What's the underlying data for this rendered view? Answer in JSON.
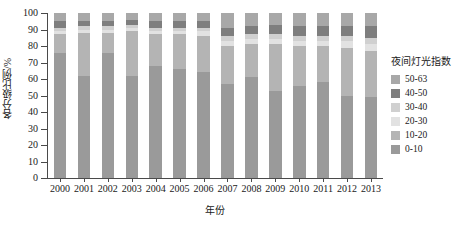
{
  "chart_data": {
    "type": "bar",
    "stacked": true,
    "title": "",
    "xlabel": "年份",
    "ylabel": "各分级比例/%",
    "ylim": [
      0,
      100
    ],
    "yticks": [
      0,
      10,
      20,
      30,
      40,
      50,
      60,
      70,
      80,
      90,
      100
    ],
    "grid": false,
    "legend_position": "right",
    "legend_title": "夜间灯光指数",
    "categories": [
      "2000",
      "2001",
      "2002",
      "2003",
      "2004",
      "2005",
      "2006",
      "2007",
      "2008",
      "2009",
      "2010",
      "2011",
      "2012",
      "2013"
    ],
    "series": [
      {
        "name": "0-10",
        "color": "#9a9a9a",
        "values": [
          76,
          62,
          76,
          62,
          68,
          66,
          64,
          57,
          61,
          53,
          56,
          58,
          50,
          49
        ]
      },
      {
        "name": "10-20",
        "color": "#b4b4b4",
        "values": [
          11,
          26,
          12,
          27,
          19,
          21,
          22,
          23,
          20,
          28,
          24,
          22,
          29,
          28
        ]
      },
      {
        "name": "20-30",
        "color": "#e2e2e2",
        "values": [
          2,
          2,
          2,
          2,
          2,
          2,
          3,
          3,
          3,
          3,
          3,
          3,
          4,
          4
        ]
      },
      {
        "name": "30-40",
        "color": "#d0d0d0",
        "values": [
          2,
          2,
          2,
          2,
          2,
          2,
          2,
          3,
          3,
          3,
          3,
          3,
          3,
          4
        ]
      },
      {
        "name": "40-50",
        "color": "#7e7e7e",
        "values": [
          4,
          3,
          3,
          3,
          4,
          4,
          4,
          5,
          5,
          6,
          6,
          6,
          6,
          7
        ]
      },
      {
        "name": "50-63",
        "color": "#a8a8a8",
        "values": [
          5,
          5,
          5,
          4,
          5,
          5,
          5,
          9,
          8,
          7,
          8,
          8,
          8,
          8
        ]
      }
    ]
  },
  "legend": {
    "title": "夜间灯光指数",
    "items": [
      {
        "label": "50-63",
        "color": "#a8a8a8"
      },
      {
        "label": "40-50",
        "color": "#7e7e7e"
      },
      {
        "label": "30-40",
        "color": "#d0d0d0"
      },
      {
        "label": "20-30",
        "color": "#e2e2e2"
      },
      {
        "label": "10-20",
        "color": "#b4b4b4"
      },
      {
        "label": "0-10",
        "color": "#9a9a9a"
      }
    ]
  },
  "axes": {
    "y_title": "各分级比例/%",
    "x_title": "年份",
    "y_tick_labels": [
      "0",
      "10",
      "20",
      "30",
      "40",
      "50",
      "60",
      "70",
      "80",
      "90",
      "100"
    ],
    "x_tick_labels": [
      "2000",
      "2001",
      "2002",
      "2003",
      "2004",
      "2005",
      "2006",
      "2007",
      "2008",
      "2009",
      "2010",
      "2011",
      "2012",
      "2013"
    ]
  }
}
